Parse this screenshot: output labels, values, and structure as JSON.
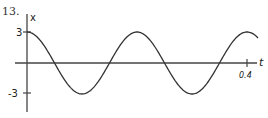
{
  "problem_number": "13.",
  "chart_data": {
    "type": "line",
    "title": "",
    "xlabel": "t",
    "ylabel": "x",
    "x_ticks": [
      {
        "value": 0.4,
        "label": "0.4"
      }
    ],
    "y_ticks": [
      {
        "value": 3,
        "label": "3"
      },
      {
        "value": -3,
        "label": "-3"
      }
    ],
    "xlim": [
      0,
      0.42
    ],
    "ylim": [
      -3.6,
      3.6
    ],
    "grid": false,
    "legend": null,
    "series": [
      {
        "name": "x(t) = 3cos(10πt)",
        "amplitude": 3,
        "period": 0.2,
        "x": [
          0,
          0.05,
          0.1,
          0.15,
          0.2,
          0.25,
          0.3,
          0.35,
          0.4
        ],
        "values": [
          3,
          0,
          -3,
          0,
          3,
          0,
          -3,
          0,
          3
        ]
      }
    ],
    "color": "#333333"
  },
  "labels": {
    "x_axis": "t",
    "y_axis": "x",
    "y_tick_pos": "3",
    "y_tick_neg": "-3",
    "x_tick": "0.4"
  }
}
